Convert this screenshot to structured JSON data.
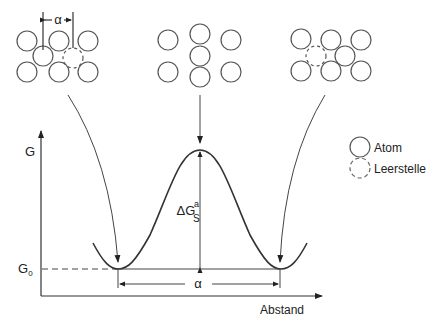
{
  "diagram": {
    "y_axis_label": "G",
    "x_axis_label": "Abstand",
    "g0_label_main": "G",
    "g0_label_sub": "0",
    "barrier_label_main": "ΔG",
    "barrier_label_sup": "a",
    "barrier_label_sub": "S",
    "distance_label": "α",
    "lattice_spacing_label": "α",
    "legend": [
      {
        "label": "Atom",
        "style": "solid-circle"
      },
      {
        "label": "Leerstelle",
        "style": "dashed-circle"
      }
    ],
    "states": [
      {
        "name": "initial",
        "description": "atom next to vacancy"
      },
      {
        "name": "saddle",
        "description": "atom squeezed between neighbors"
      },
      {
        "name": "final",
        "description": "atom moved into vacancy"
      }
    ],
    "colors": {
      "line": "#333333",
      "text": "#222222",
      "background": "#ffffff"
    }
  }
}
